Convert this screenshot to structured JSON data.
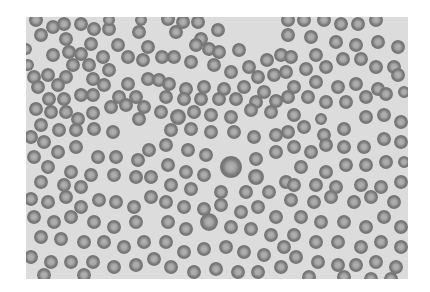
{
  "image": {
    "subject": "Grayscale light-microscope photograph of a blood smear showing many red blood cells (erythrocytes)",
    "frame": {
      "x": 26,
      "y": 17,
      "width": 382,
      "height": 262
    },
    "colors": {
      "page_background": "#ffffff",
      "slide_background": "#dcdcdc",
      "cell_ring": "#767676",
      "cell_center": "#a9a9a9"
    },
    "cells": [
      [
        10,
        3,
        7
      ],
      [
        15,
        18,
        7
      ],
      [
        27,
        10,
        7
      ],
      [
        38,
        7,
        7
      ],
      [
        55,
        7,
        7
      ],
      [
        68,
        12,
        7
      ],
      [
        83,
        12,
        7
      ],
      [
        83,
        3,
        6
      ],
      [
        113,
        15,
        7
      ],
      [
        115,
        3,
        6
      ],
      [
        40,
        22,
        7
      ],
      [
        65,
        27,
        7
      ],
      [
        92,
        28,
        7
      ],
      [
        122,
        30,
        7
      ],
      [
        27,
        38,
        7
      ],
      [
        43,
        35,
        7
      ],
      [
        55,
        37,
        7
      ],
      [
        77,
        40,
        7
      ],
      [
        102,
        40,
        7
      ],
      [
        117,
        43,
        7
      ],
      [
        47,
        48,
        7
      ],
      [
        63,
        48,
        7
      ],
      [
        83,
        53,
        7
      ],
      [
        8,
        60,
        7
      ],
      [
        22,
        58,
        7
      ],
      [
        40,
        60,
        7
      ],
      [
        67,
        62,
        7
      ],
      [
        78,
        68,
        7
      ],
      [
        102,
        67,
        7
      ],
      [
        122,
        62,
        7
      ],
      [
        12,
        70,
        7
      ],
      [
        32,
        68,
        7
      ],
      [
        55,
        78,
        7
      ],
      [
        67,
        78,
        7
      ],
      [
        93,
        80,
        7
      ],
      [
        110,
        80,
        7
      ],
      [
        23,
        82,
        7
      ],
      [
        38,
        82,
        7
      ],
      [
        0,
        32,
        6
      ],
      [
        2,
        48,
        6
      ],
      [
        142,
        2,
        7
      ],
      [
        157,
        5,
        7
      ],
      [
        172,
        5,
        7
      ],
      [
        192,
        13,
        7
      ],
      [
        150,
        15,
        7
      ],
      [
        175,
        22,
        7
      ],
      [
        183,
        32,
        7
      ],
      [
        170,
        28,
        7
      ],
      [
        193,
        35,
        7
      ],
      [
        213,
        33,
        7
      ],
      [
        136,
        40,
        7
      ],
      [
        148,
        40,
        7
      ],
      [
        165,
        45,
        7
      ],
      [
        188,
        48,
        7
      ],
      [
        205,
        55,
        7
      ],
      [
        223,
        50,
        7
      ],
      [
        241,
        43,
        7
      ],
      [
        232,
        60,
        7
      ],
      [
        248,
        58,
        7
      ],
      [
        133,
        63,
        7
      ],
      [
        143,
        67,
        7
      ],
      [
        160,
        72,
        7
      ],
      [
        178,
        70,
        7
      ],
      [
        198,
        72,
        7
      ],
      [
        218,
        70,
        7
      ],
      [
        238,
        75,
        7
      ],
      [
        255,
        38,
        7
      ],
      [
        140,
        80,
        7
      ],
      [
        158,
        82,
        7
      ],
      [
        175,
        82,
        7
      ],
      [
        193,
        82,
        7
      ],
      [
        210,
        82,
        7
      ],
      [
        230,
        85,
        7
      ],
      [
        250,
        84,
        7
      ],
      [
        262,
        3,
        7
      ],
      [
        278,
        3,
        7
      ],
      [
        298,
        3,
        7
      ],
      [
        315,
        7,
        7
      ],
      [
        332,
        7,
        7
      ],
      [
        350,
        3,
        7
      ],
      [
        262,
        18,
        7
      ],
      [
        285,
        20,
        7
      ],
      [
        310,
        25,
        7
      ],
      [
        330,
        28,
        7
      ],
      [
        352,
        25,
        7
      ],
      [
        372,
        30,
        7
      ],
      [
        265,
        40,
        7
      ],
      [
        290,
        38,
        7
      ],
      [
        300,
        50,
        7
      ],
      [
        317,
        42,
        7
      ],
      [
        335,
        42,
        7
      ],
      [
        350,
        50,
        7
      ],
      [
        368,
        50,
        7
      ],
      [
        260,
        55,
        7
      ],
      [
        280,
        52,
        7
      ],
      [
        268,
        70,
        7
      ],
      [
        290,
        65,
        7
      ],
      [
        312,
        70,
        7
      ],
      [
        330,
        67,
        7
      ],
      [
        352,
        72,
        7
      ],
      [
        372,
        58,
        7
      ],
      [
        262,
        80,
        7
      ],
      [
        282,
        80,
        7
      ],
      [
        300,
        85,
        7
      ],
      [
        320,
        85,
        7
      ],
      [
        340,
        80,
        7
      ],
      [
        360,
        77,
        7
      ],
      [
        378,
        75,
        6
      ],
      [
        10,
        92,
        7
      ],
      [
        25,
        95,
        7
      ],
      [
        40,
        95,
        7
      ],
      [
        52,
        102,
        7
      ],
      [
        67,
        96,
        7
      ],
      [
        85,
        90,
        7
      ],
      [
        100,
        88,
        7
      ],
      [
        118,
        90,
        7
      ],
      [
        15,
        108,
        7
      ],
      [
        33,
        113,
        7
      ],
      [
        50,
        113,
        7
      ],
      [
        68,
        112,
        7
      ],
      [
        87,
        115,
        7
      ],
      [
        113,
        102,
        7
      ],
      [
        5,
        120,
        7
      ],
      [
        18,
        125,
        7
      ],
      [
        32,
        135,
        7
      ],
      [
        50,
        130,
        7
      ],
      [
        72,
        140,
        7
      ],
      [
        90,
        140,
        7
      ],
      [
        112,
        143,
        7
      ],
      [
        123,
        133,
        7
      ],
      [
        8,
        140,
        7
      ],
      [
        22,
        150,
        7
      ],
      [
        45,
        155,
        7
      ],
      [
        65,
        158,
        7
      ],
      [
        88,
        158,
        7
      ],
      [
        110,
        160,
        7
      ],
      [
        125,
        160,
        7
      ],
      [
        15,
        165,
        7
      ],
      [
        38,
        168,
        7
      ],
      [
        55,
        170,
        7
      ],
      [
        135,
        95,
        7
      ],
      [
        152,
        100,
        8
      ],
      [
        168,
        95,
        7
      ],
      [
        185,
        98,
        7
      ],
      [
        205,
        100,
        7
      ],
      [
        225,
        93,
        7
      ],
      [
        245,
        95,
        7
      ],
      [
        145,
        113,
        7
      ],
      [
        165,
        112,
        7
      ],
      [
        185,
        115,
        7
      ],
      [
        208,
        115,
        7
      ],
      [
        228,
        120,
        7
      ],
      [
        250,
        118,
        7
      ],
      [
        140,
        128,
        7
      ],
      [
        162,
        133,
        7
      ],
      [
        180,
        138,
        7
      ],
      [
        205,
        150,
        11
      ],
      [
        230,
        142,
        7
      ],
      [
        230,
        160,
        8
      ],
      [
        250,
        135,
        7
      ],
      [
        142,
        148,
        7
      ],
      [
        160,
        155,
        7
      ],
      [
        178,
        158,
        7
      ],
      [
        145,
        168,
        7
      ],
      [
        165,
        172,
        7
      ],
      [
        195,
        175,
        7
      ],
      [
        220,
        175,
        7
      ],
      [
        243,
        175,
        7
      ],
      [
        260,
        165,
        7
      ],
      [
        268,
        98,
        7
      ],
      [
        262,
        115,
        7
      ],
      [
        278,
        110,
        7
      ],
      [
        298,
        118,
        7
      ],
      [
        318,
        112,
        7
      ],
      [
        340,
        100,
        7
      ],
      [
        358,
        98,
        7
      ],
      [
        375,
        105,
        7
      ],
      [
        268,
        130,
        7
      ],
      [
        285,
        135,
        7
      ],
      [
        300,
        128,
        7
      ],
      [
        318,
        130,
        7
      ],
      [
        338,
        130,
        7
      ],
      [
        358,
        122,
        7
      ],
      [
        375,
        125,
        7
      ],
      [
        275,
        150,
        7
      ],
      [
        300,
        155,
        7
      ],
      [
        320,
        148,
        7
      ],
      [
        340,
        148,
        7
      ],
      [
        360,
        145,
        7
      ],
      [
        378,
        145,
        6
      ],
      [
        268,
        168,
        7
      ],
      [
        290,
        168,
        7
      ],
      [
        310,
        170,
        7
      ],
      [
        335,
        168,
        7
      ],
      [
        355,
        170,
        7
      ],
      [
        375,
        165,
        7
      ],
      [
        5,
        182,
        7
      ],
      [
        22,
        185,
        7
      ],
      [
        40,
        180,
        7
      ],
      [
        55,
        190,
        7
      ],
      [
        73,
        183,
        7
      ],
      [
        90,
        185,
        7
      ],
      [
        108,
        190,
        7
      ],
      [
        125,
        180,
        7
      ],
      [
        8,
        200,
        7
      ],
      [
        28,
        205,
        7
      ],
      [
        45,
        200,
        7
      ],
      [
        68,
        205,
        7
      ],
      [
        88,
        210,
        7
      ],
      [
        110,
        205,
        7
      ],
      [
        15,
        220,
        7
      ],
      [
        35,
        222,
        7
      ],
      [
        58,
        225,
        7
      ],
      [
        78,
        225,
        7
      ],
      [
        98,
        230,
        7
      ],
      [
        118,
        225,
        7
      ],
      [
        5,
        240,
        7
      ],
      [
        25,
        245,
        7
      ],
      [
        45,
        245,
        7
      ],
      [
        67,
        245,
        7
      ],
      [
        88,
        250,
        7
      ],
      [
        110,
        248,
        7
      ],
      [
        128,
        242,
        7
      ],
      [
        18,
        258,
        7
      ],
      [
        58,
        258,
        7
      ],
      [
        140,
        185,
        7
      ],
      [
        158,
        190,
        7
      ],
      [
        178,
        192,
        7
      ],
      [
        195,
        188,
        7
      ],
      [
        215,
        195,
        7
      ],
      [
        232,
        190,
        7
      ],
      [
        250,
        200,
        7
      ],
      [
        142,
        205,
        7
      ],
      [
        160,
        212,
        7
      ],
      [
        183,
        205,
        9
      ],
      [
        205,
        210,
        7
      ],
      [
        225,
        212,
        7
      ],
      [
        245,
        218,
        7
      ],
      [
        140,
        225,
        7
      ],
      [
        158,
        235,
        7
      ],
      [
        178,
        232,
        7
      ],
      [
        200,
        230,
        7
      ],
      [
        218,
        235,
        7
      ],
      [
        238,
        238,
        7
      ],
      [
        258,
        230,
        7
      ],
      [
        145,
        250,
        7
      ],
      [
        168,
        255,
        7
      ],
      [
        190,
        252,
        7
      ],
      [
        212,
        255,
        7
      ],
      [
        232,
        255,
        7
      ],
      [
        255,
        250,
        7
      ],
      [
        265,
        183,
        7
      ],
      [
        288,
        185,
        7
      ],
      [
        305,
        180,
        7
      ],
      [
        328,
        185,
        7
      ],
      [
        345,
        180,
        7
      ],
      [
        368,
        185,
        7
      ],
      [
        275,
        200,
        7
      ],
      [
        295,
        205,
        7
      ],
      [
        318,
        205,
        7
      ],
      [
        340,
        210,
        7
      ],
      [
        358,
        200,
        7
      ],
      [
        375,
        210,
        7
      ],
      [
        268,
        218,
        7
      ],
      [
        290,
        225,
        7
      ],
      [
        312,
        225,
        7
      ],
      [
        335,
        230,
        7
      ],
      [
        355,
        225,
        7
      ],
      [
        375,
        230,
        7
      ],
      [
        270,
        240,
        7
      ],
      [
        292,
        245,
        7
      ],
      [
        312,
        248,
        7
      ],
      [
        330,
        248,
        7
      ],
      [
        350,
        245,
        7
      ],
      [
        370,
        250,
        7
      ],
      [
        283,
        260,
        7
      ],
      [
        318,
        260,
        7
      ],
      [
        345,
        262,
        7
      ],
      [
        365,
        262,
        7
      ],
      [
        295,
        102,
        6
      ]
    ]
  }
}
